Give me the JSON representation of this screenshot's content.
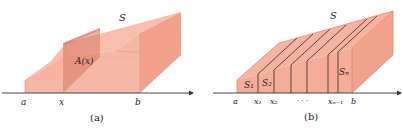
{
  "colors": {
    "solid_light": "#f9c3b4",
    "solid_mid": "#f4a793",
    "solid_dark": "#e8836c",
    "slice": "#d9735d",
    "edge": "#e07a66",
    "divider": "#3a2420",
    "axis": "#333333"
  },
  "panel_a": {
    "solid_label": "S",
    "cross_section_label": "A(x)",
    "axis_labels": [
      "a",
      "x",
      "b"
    ],
    "caption": "(a)"
  },
  "panel_b": {
    "solid_label": "S",
    "slab_labels": {
      "first": "S₁",
      "second": "S₂",
      "last": "Sₙ"
    },
    "axis_labels": [
      "a",
      "x₁",
      "x₂",
      "· · ·",
      "xₙ₋₁",
      "b"
    ],
    "caption": "(b)"
  }
}
